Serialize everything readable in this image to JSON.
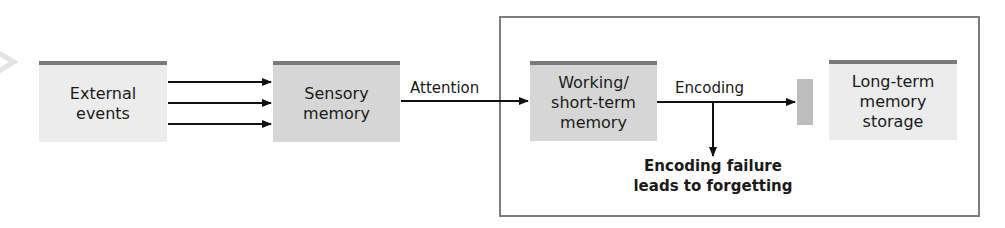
{
  "diagram": {
    "nodes": [
      {
        "id": "external",
        "label": "External events"
      },
      {
        "id": "sensory",
        "label": "Sensory memory"
      },
      {
        "id": "working",
        "label_line1": "Working/",
        "label_line2": "short-term",
        "label_line3": "memory"
      },
      {
        "id": "longterm",
        "label_line1": "Long-term",
        "label_line2": "memory",
        "label_line3": "storage"
      }
    ],
    "external": {
      "line1": "External",
      "line2": "events"
    },
    "sensory": {
      "line1": "Sensory",
      "line2": "memory"
    },
    "working": {
      "line1": "Working/",
      "line2": "short-term",
      "line3": "memory"
    },
    "longterm": {
      "line1": "Long-term",
      "line2": "memory",
      "line3": "storage"
    },
    "edges": {
      "attention": "Attention",
      "encoding": "Encoding",
      "failure_line1": "Encoding failure",
      "failure_line2": "leads to forgetting"
    },
    "colors": {
      "box_fill": "#ececec",
      "box_fill_working": "#d6d6d6",
      "box_bar": "#7a7a7a",
      "frame": "#7d7d7d",
      "gate": "#bdbdbd"
    }
  }
}
